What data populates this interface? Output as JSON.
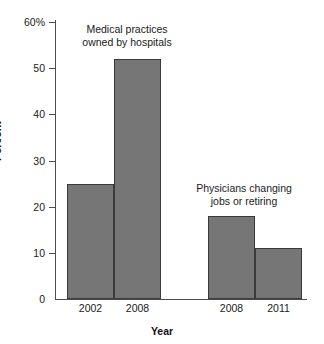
{
  "chart_data": {
    "type": "bar",
    "title": "",
    "xlabel": "Year",
    "ylabel": "Percent",
    "ylim": [
      0,
      60
    ],
    "grid": false,
    "legend": "none",
    "categories": [
      "2002",
      "2008",
      "2008",
      "2011"
    ],
    "values": [
      25,
      52,
      18,
      11
    ],
    "ytick_values": [
      0,
      10,
      20,
      30,
      40,
      50,
      60
    ],
    "ytick_labels": [
      "0",
      "10",
      "20",
      "30",
      "40",
      "50",
      "60%"
    ],
    "annotations": [
      {
        "text": "Medical practices\nowned by hospitals",
        "applies_to_categories": [
          "2002",
          "2008"
        ],
        "applies_to_values": [
          25,
          52
        ]
      },
      {
        "text": "Physicians changing\njobs or retiring",
        "applies_to_categories": [
          "2008",
          "2011"
        ],
        "applies_to_values": [
          18,
          11
        ]
      }
    ],
    "groups": [
      {
        "label": "Medical practices owned by hospitals",
        "categories": [
          "2002",
          "2008"
        ],
        "values": [
          25,
          52
        ]
      },
      {
        "label": "Physicians changing jobs or retiring",
        "categories": [
          "2008",
          "2011"
        ],
        "values": [
          18,
          11
        ]
      }
    ],
    "bar_color": "#767676",
    "bar_edge_color": "#3a3a3a",
    "axis_color": "#4d4d4d"
  }
}
